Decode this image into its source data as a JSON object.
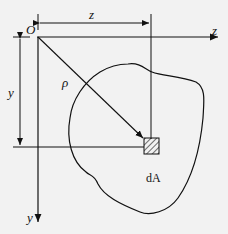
{
  "diagram": {
    "origin_label": "O",
    "axis_z_label": "z",
    "axis_y_label": "y",
    "dim_z_label": "z",
    "dim_y_label": "y",
    "radius_label": "ρ",
    "element_label": "dA"
  },
  "colors": {
    "background": "#f2f2f2",
    "ink": "#111111"
  }
}
